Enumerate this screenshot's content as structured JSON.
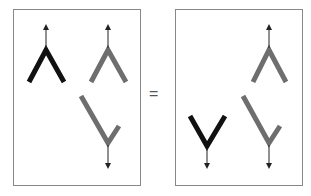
{
  "equation": {
    "operator": "="
  },
  "colors": {
    "primary": "#111111",
    "secondary": "#6e6e6e",
    "frame": "#888888",
    "arrow": "#222222"
  },
  "left_panel": {
    "elements": [
      {
        "name": "black-up-caret",
        "color": "primary",
        "arrow": "up"
      },
      {
        "name": "gray-up-caret",
        "color": "secondary",
        "arrow": "up"
      },
      {
        "name": "gray-down-check",
        "color": "secondary",
        "arrow": "down"
      }
    ]
  },
  "right_panel": {
    "elements": [
      {
        "name": "black-down-caret",
        "color": "primary",
        "arrow": "down"
      },
      {
        "name": "gray-up-caret",
        "color": "secondary",
        "arrow": "up"
      },
      {
        "name": "gray-down-check",
        "color": "secondary",
        "arrow": "down"
      }
    ]
  }
}
